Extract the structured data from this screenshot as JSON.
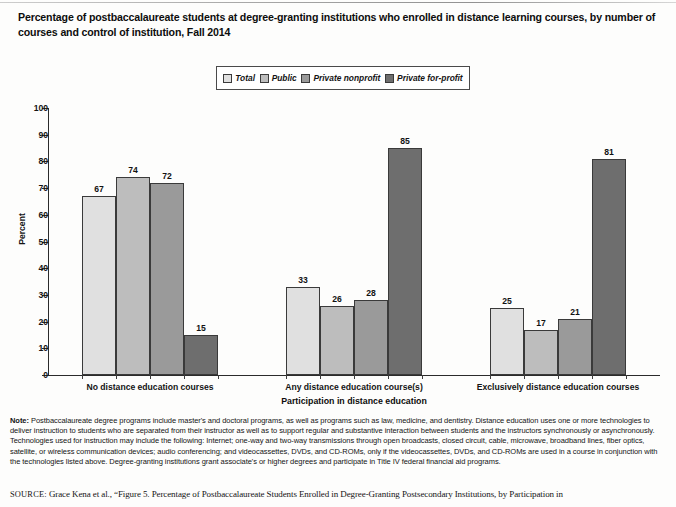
{
  "figure": {
    "title": "Percentage of postbaccalaureate students at degree-granting institutions who enrolled in distance learning courses, by number of courses and control of institution, Fall 2014"
  },
  "chart_data": {
    "type": "bar",
    "title": "Percentage of postbaccalaureate students at degree-granting institutions who enrolled in distance learning courses, by number of courses and control of institution, Fall 2014",
    "xlabel": "Participation in distance education",
    "ylabel": "Percent",
    "ylim": [
      0,
      100
    ],
    "ytick_step": 10,
    "yticks": [
      100,
      90,
      80,
      70,
      60,
      50,
      40,
      30,
      20,
      10,
      0
    ],
    "grid": false,
    "legend_position": "top-center",
    "categories": [
      "No distance education courses",
      "Any distance education course(s)",
      "Exclusively distance education courses"
    ],
    "series": [
      {
        "name": "Total",
        "color": "#e0e0e0",
        "values": [
          67,
          33,
          25
        ]
      },
      {
        "name": "Public",
        "color": "#bdbdbd",
        "values": [
          74,
          26,
          17
        ]
      },
      {
        "name": "Private nonprofit",
        "color": "#9a9a9a",
        "values": [
          72,
          28,
          21
        ]
      },
      {
        "name": "Private for-profit",
        "color": "#6e6e6e",
        "values": [
          15,
          85,
          81
        ]
      }
    ]
  },
  "legend": {
    "items": [
      {
        "label": "Total",
        "swatch": "#e0e0e0"
      },
      {
        "label": "Public",
        "swatch": "#bdbdbd"
      },
      {
        "label": "Private nonprofit",
        "swatch": "#9a9a9a"
      },
      {
        "label": "Private for-profit",
        "swatch": "#6e6e6e"
      }
    ]
  },
  "footer": {
    "note_label": "Note:",
    "note_text": " Postbaccalaureate degree programs include master's and doctoral programs, as well as programs such as law, medicine, and dentistry. Distance education uses one or more technologies to deliver instruction to students who are separated from their instructor as well as to support regular and substantive interaction between students and the instructors synchronously or asynchronously. Technologies used for instruction may include the following: Internet; one-way and two-way transmissions through open broadcasts, closed circuit, cable, microwave, broadband lines, fiber optics, satellite, or wireless communication devices; audio conferencing; and videocassettes, DVDs, and CD-ROMs, only if the videocassettes, DVDs, and CD-ROMs are used in a course in conjunction with the technologies listed above. Degree-granting institutions grant associate's or higher degrees and participate in Title IV federal financial aid programs.",
    "source_label": "SOURCE:",
    "source_text": " Grace Kena et al., “Figure 5. Percentage of Postbaccalaureate Students Enrolled in Degree-Granting Postsecondary Institutions, by Participation in"
  }
}
